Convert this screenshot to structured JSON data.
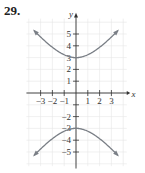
{
  "problem_number": "29.",
  "chart_data": {
    "type": "line",
    "title": "",
    "xlabel": "x",
    "ylabel": "y",
    "x_ticks": [
      -3,
      -2,
      -1,
      1,
      2,
      3
    ],
    "y_ticks": [
      -5,
      -4,
      -3,
      -2,
      1,
      2,
      3,
      4,
      5
    ],
    "x_tick_labels": [
      "−3",
      "−2",
      "−1",
      "1",
      "2",
      "3"
    ],
    "y_tick_labels": [
      "5",
      "4",
      "3",
      "2",
      "1",
      "−2",
      "−3",
      "−4",
      "−5"
    ],
    "xlim": [
      -4,
      4
    ],
    "ylim": [
      -6,
      6
    ],
    "grid": true,
    "series": [
      {
        "name": "upper branch",
        "x": [
          -3.5,
          -2,
          -1,
          0,
          1,
          2,
          3.5
        ],
        "y": [
          5.6,
          3.8,
          3.2,
          3,
          3.2,
          3.8,
          5.6
        ]
      },
      {
        "name": "lower branch",
        "x": [
          -3.5,
          -2,
          -1,
          0,
          1,
          2,
          3.5
        ],
        "y": [
          -5.6,
          -3.8,
          -3.2,
          -3,
          -3.2,
          -3.8,
          -5.6
        ]
      }
    ],
    "annotations": [
      "vertices at (0, 3) and (0, -3)",
      "arrows at branch ends"
    ]
  },
  "colors": {
    "curve": "#7a7f86",
    "axis": "#333333",
    "grid": "#e6e6e6"
  }
}
